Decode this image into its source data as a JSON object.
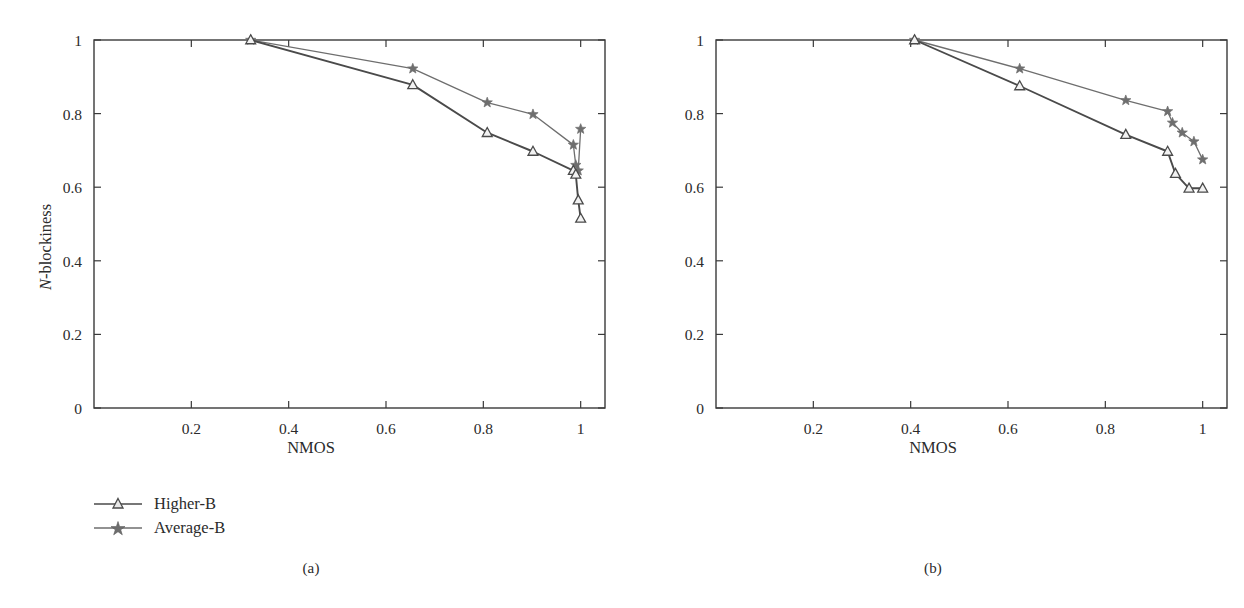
{
  "figure": {
    "panels": [
      {
        "id": "a",
        "caption": "(a)",
        "xlabel": "NMOS",
        "ylabel_prefix": "N",
        "ylabel_suffix": "-blockiness"
      },
      {
        "id": "b",
        "caption": "(b)",
        "xlabel": "NMOS",
        "ylabel_prefix": "N",
        "ylabel_suffix": "-blockiness"
      }
    ],
    "legend": {
      "higher_label": "Higher-B",
      "average_label": "Average-B"
    },
    "colors": {
      "higher_b": "#4a4a4a",
      "average_b": "#6e6e6e",
      "axis": "#3a3a3a",
      "text": "#2b2b2b",
      "background": "#ffffff"
    }
  },
  "chart_data": [
    {
      "type": "line",
      "panel": "a",
      "title": "(a)",
      "xlabel": "NMOS",
      "ylabel": "N-blockiness",
      "xlim": [
        0,
        1.05
      ],
      "ylim": [
        0,
        1
      ],
      "xticks": [
        0.2,
        0.4,
        0.6,
        0.8,
        1
      ],
      "xticklabels": [
        "0.2",
        "0.4",
        "0.6",
        "0.8",
        "1"
      ],
      "yticks": [
        0,
        0.2,
        0.4,
        0.6,
        0.8,
        1
      ],
      "yticklabels": [
        "0",
        "0.2",
        "0.4",
        "0.6",
        "0.8",
        "1"
      ],
      "grid": false,
      "legend_position": "below-left",
      "series": [
        {
          "name": "Higher-B",
          "marker": "triangle",
          "x": [
            0.322,
            0.655,
            0.808,
            0.902,
            0.985,
            0.99,
            0.995,
            1.0
          ],
          "y": [
            1.0,
            0.878,
            0.748,
            0.697,
            0.645,
            0.635,
            0.565,
            0.515
          ]
        },
        {
          "name": "Average-B",
          "marker": "star",
          "x": [
            0.322,
            0.655,
            0.808,
            0.902,
            0.985,
            0.99,
            0.995,
            1.0
          ],
          "y": [
            1.0,
            0.922,
            0.83,
            0.798,
            0.715,
            0.66,
            0.645,
            0.758
          ]
        }
      ]
    },
    {
      "type": "line",
      "panel": "b",
      "title": "(b)",
      "xlabel": "NMOS",
      "ylabel": "N-blockiness",
      "xlim": [
        0,
        1.05
      ],
      "ylim": [
        0,
        1
      ],
      "xticks": [
        0.2,
        0.4,
        0.6,
        0.8,
        1
      ],
      "xticklabels": [
        "0.2",
        "0.4",
        "0.6",
        "0.8",
        "1"
      ],
      "yticks": [
        0,
        0.2,
        0.4,
        0.6,
        0.8,
        1
      ],
      "yticklabels": [
        "0",
        "0.2",
        "0.4",
        "0.6",
        "0.8",
        "1"
      ],
      "grid": false,
      "legend_position": "below-left",
      "series": [
        {
          "name": "Higher-B",
          "marker": "triangle",
          "x": [
            0.408,
            0.624,
            0.842,
            0.928,
            0.944,
            0.972,
            1.0
          ],
          "y": [
            1.0,
            0.875,
            0.743,
            0.697,
            0.637,
            0.597,
            0.597
          ]
        },
        {
          "name": "Average-B",
          "marker": "star",
          "x": [
            0.408,
            0.624,
            0.842,
            0.928,
            0.938,
            0.958,
            0.982,
            1.0
          ],
          "y": [
            1.0,
            0.922,
            0.836,
            0.806,
            0.775,
            0.748,
            0.724,
            0.675
          ]
        }
      ]
    }
  ]
}
